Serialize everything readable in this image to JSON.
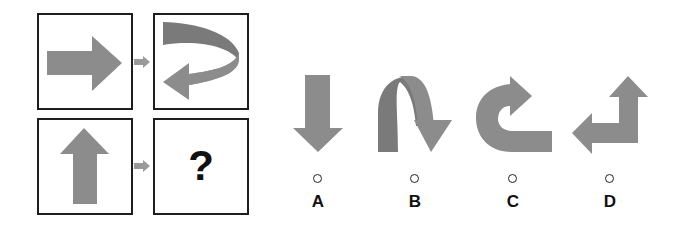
{
  "puzzle": {
    "grid": {
      "top_left": {
        "shape": "arrow-right"
      },
      "top_right": {
        "shape": "curled-arrow-right-to-left"
      },
      "bottom_left": {
        "shape": "arrow-up"
      },
      "bottom_right": {
        "text": "?"
      }
    },
    "connector": "arrow-right-icon"
  },
  "options": [
    {
      "label": "A",
      "shape": "arrow-down"
    },
    {
      "label": "B",
      "shape": "arch-arrow-down"
    },
    {
      "label": "C",
      "shape": "u-turn-arrow-right"
    },
    {
      "label": "D",
      "shape": "elbow-arrow-up-left"
    }
  ],
  "colors": {
    "shape_fill": "#8c8c8c",
    "shape_dark": "#7a7a7a",
    "connector_fill": "#9a9a9a",
    "border": "#1e1e1e"
  }
}
